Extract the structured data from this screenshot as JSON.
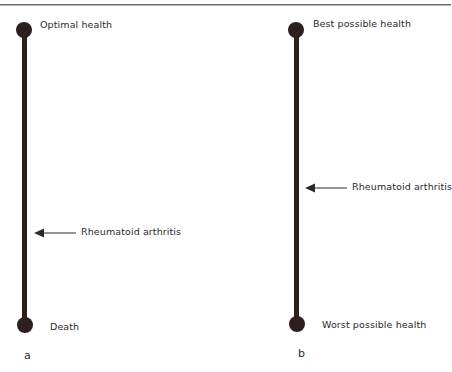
{
  "header": {
    "rule": "top-rule"
  },
  "panels": [
    {
      "letter": "a",
      "top_label": "Optimal health",
      "bottom_label": "Death",
      "marker_label": "Rheumatoid arthritis",
      "marker_position_fraction": 0.69
    },
    {
      "letter": "b",
      "top_label": "Best possible health",
      "bottom_label": "Worst possible health",
      "marker_label": "Rheumatoid arthritis",
      "marker_position_fraction": 0.54
    }
  ],
  "colors": {
    "scale_line": "#2e1f1f",
    "arrow": "#2a2a2a",
    "text": "#2a2a2a"
  }
}
